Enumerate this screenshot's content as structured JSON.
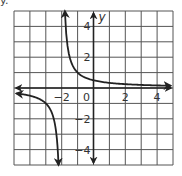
{
  "corner_fragment": "y.",
  "chart_data": {
    "type": "line",
    "title": "",
    "function": "y = 1/(x+2)",
    "xlabel": "",
    "ylabel": "y",
    "xlim": [
      -5,
      5
    ],
    "ylim": [
      -5,
      5
    ],
    "grid": true,
    "grid_step": 1,
    "x_tick_labels": [
      {
        "value": -2,
        "label": "−2"
      },
      {
        "value": 0,
        "label": "0"
      },
      {
        "value": 2,
        "label": "2"
      },
      {
        "value": 4,
        "label": "4"
      }
    ],
    "y_tick_labels": [
      {
        "value": 4,
        "label": "4"
      },
      {
        "value": 2,
        "label": "2"
      },
      {
        "value": -2,
        "label": "−2"
      },
      {
        "value": -4,
        "label": "−4"
      }
    ],
    "vertical_asymptote": -2,
    "horizontal_asymptote": 0,
    "series": [
      {
        "name": "right-branch",
        "x": [
          -1.8,
          -1.6,
          -1.4,
          -1.2,
          -1.0,
          -0.5,
          0,
          1,
          2,
          3,
          4,
          4.8
        ],
        "y": [
          5,
          2.5,
          1.67,
          1.25,
          1.0,
          0.67,
          0.5,
          0.33,
          0.25,
          0.2,
          0.17,
          0.15
        ]
      },
      {
        "name": "left-branch",
        "x": [
          -4.8,
          -4,
          -3,
          -2.6,
          -2.4,
          -2.3,
          -2.2
        ],
        "y": [
          -0.36,
          -0.5,
          -1.0,
          -1.67,
          -2.5,
          -3.33,
          -5
        ]
      }
    ],
    "colors": {
      "grid": "#555555",
      "axis": "#222222",
      "curve": "#222222",
      "label": "#333333"
    }
  }
}
